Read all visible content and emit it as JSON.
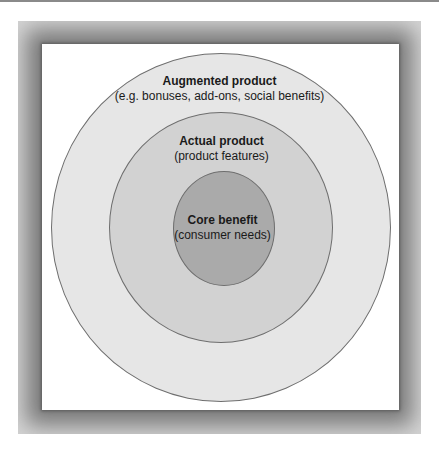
{
  "diagram": {
    "type": "concentric-circles",
    "levels": [
      {
        "title": "Augmented product",
        "subtitle": "(e.g. bonuses, add-ons, social benefits)",
        "fill": "#e6e6e6"
      },
      {
        "title": "Actual product",
        "subtitle": "(product features)",
        "fill": "#d2d2d2"
      },
      {
        "title": "Core benefit",
        "subtitle": "(consumer needs)",
        "fill": "#aaaaaa"
      }
    ],
    "frame_color": "#7a7a7a",
    "outline_color": "#6e6e6e"
  }
}
